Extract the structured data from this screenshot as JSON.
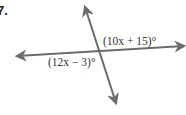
{
  "problem": {
    "number": "7."
  },
  "diagram": {
    "type": "intersecting-lines",
    "line_color": "#6b6b6b",
    "text_color": "#333333",
    "lines": [
      {
        "name": "transversal",
        "from": [
          117,
          104
        ],
        "to": [
          84,
          6
        ]
      },
      {
        "name": "horizontal",
        "from": [
          185,
          46
        ],
        "to": [
          16,
          56
        ]
      }
    ],
    "angles": [
      {
        "name": "upper-right-angle",
        "label": "(10x + 15)°"
      },
      {
        "name": "lower-left-angle",
        "label": "(12x − 3)°"
      }
    ]
  }
}
